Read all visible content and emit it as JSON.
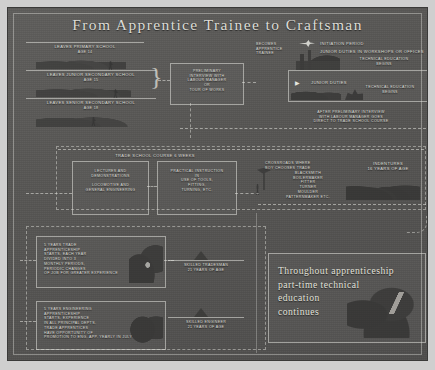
{
  "poster": {
    "title": "From Apprentice Trainee to Craftsman",
    "background_color": "#565553",
    "text_color": "#dedeD8",
    "frame_color": "#e1e1dc"
  },
  "schools": [
    {
      "name": "leaves-primary-school",
      "line1": "LEAVES PRIMARY SCHOOL",
      "line2": "AGE 14"
    },
    {
      "name": "leaves-junior-secondary-school",
      "line1": "LEAVES JUNIOR SECONDARY SCHOOL",
      "line2": "AGE 15"
    },
    {
      "name": "leaves-senior-secondary-school",
      "line1": "LEAVES SENIOR SECONDARY SCHOOL",
      "line2": "AGE 18"
    }
  ],
  "interview": {
    "text": "PRELIMINARY\nINTERVIEW WITH\nLABOUR MANAGER\nOR\nTOUR OF WORKS"
  },
  "becomes_trainee": {
    "text": "BECOMES\nAPPRENTICE\nTRAINEE"
  },
  "initiation": {
    "heading": "INITIATION PERIOD",
    "duties": "JUNIOR DUTIES IN WORKSHOPS OR OFFICES",
    "technical": "TECHNICAL EDUCATION\nBEGINS"
  },
  "junior_duties_box": {
    "label": "JUNIOR DUTIES",
    "technical": "TECHNICAL EDUCATION\nBEGINS"
  },
  "direct_route": {
    "text": "AFTER PRELIMINARY INTERVIEW\nWITH LABOUR MANAGER GOES\nDIRECT TO TRADE SCHOOL COURSE"
  },
  "trade_school": {
    "header": "TRADE SCHOOL COURSE 6 WEEKS",
    "left_box": "LECTURES  AND\nDEMONSTRATIONS\n\nLOCOMOTIVE AND\nGENERAL ENGINEERING",
    "right_box": "PRACTICAL INSTRUCTION\nIN\nUSE OF TOOLS,\nFITTING,\nTURNING, ETC."
  },
  "crossroads": {
    "heading": "CROSSROADS WHERE\nBOY CHOOSES TRADE",
    "trades": "BLACKSMITH\nBOILERMAKER\nFITTER\nTURNER\nMOULDER\nPATTERNMAKER ETC."
  },
  "indentures": {
    "text": "INDENTURES\n16 YEARS OF AGE"
  },
  "trade_apprenticeship": {
    "text": "5 YEARS TRADE\nAPPRENTICESHIP\nSTARTS. EACH YEAR\nDIVIDED INTO 3\nMONTHLY PERIODS,\nPERIODIC CHANGES\nOF JOB FOR GREATER EXPERIENCE"
  },
  "engineering_apprenticeship": {
    "text": "5 YEARS ENGINEERING\nAPPRENTICESHIP\nSTARTS. EXPERIENCE\nIN ALL PRINCIPAL DEPTS.\nTRADE APPRENTICES\nHAVE OPPORTUNITY OF\nPROMOTION TO ENG. APP. YEARLY IN JULY"
  },
  "skilled_tradesman": {
    "line1": "SKILLED TRADESMAN",
    "line2": "21 YEARS OF AGE"
  },
  "skilled_engineer": {
    "line1": "SKILLED ENGINEER",
    "line2": "21 YEARS OF AGE"
  },
  "continuing_education": {
    "text": "Throughout apprenticeship\npart-time technical\neducation\ncontinues"
  }
}
